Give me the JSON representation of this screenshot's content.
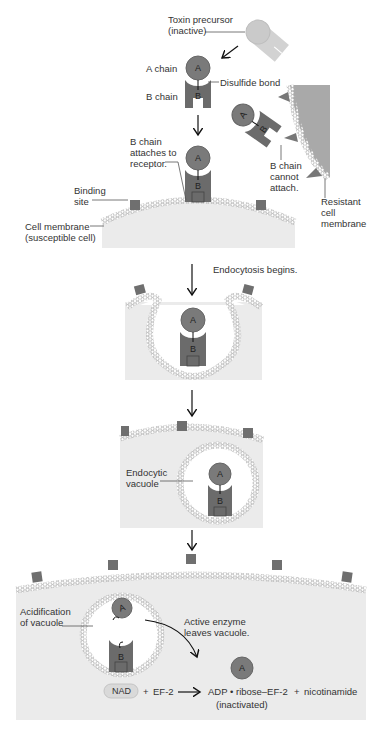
{
  "figure": {
    "colors": {
      "chain": "#6b6b6b",
      "chain_a": "#7a7a7a",
      "precursor": "#cfcfcf",
      "cell_fill": "#ebebeb",
      "membrane": "#bdbdbd",
      "resistant_cell": "#a9a9a9",
      "receptor": "#6f6f6f",
      "nad_pill": "#d9d9d9",
      "text": "#333333"
    },
    "chain_letters": {
      "a": "A",
      "b": "B"
    }
  },
  "step1": {
    "toxin_precursor": "Toxin precursor\n(inactive)",
    "a_chain": "A chain",
    "b_chain": "B chain",
    "disulfide_bond": "Disulfide bond",
    "b_chain_attaches": "B chain\nattaches to\nreceptor.",
    "b_chain_cannot_attach": "B chain\ncannot\nattach.",
    "binding_site": "Binding\nsite",
    "cell_membrane": "Cell membrane\n(susceptible cell)",
    "resistant_membrane": "Resistant\ncell\nmembrane"
  },
  "step2": {
    "endocytosis": "Endocytosis begins."
  },
  "step3": {
    "endocytic_vacuole": "Endocytic\nvacuole"
  },
  "step4": {
    "acidification": "Acidification\nof vacuole",
    "active_enzyme": "Active enzyme\nleaves vacuole.",
    "equation": {
      "nad": "NAD",
      "plus1": "+",
      "ef2": "EF-2",
      "product": "ADP • ribose–EF-2",
      "plus2": "+",
      "nicotinamide": "nicotinamide",
      "inactivated": "(inactivated)"
    }
  }
}
